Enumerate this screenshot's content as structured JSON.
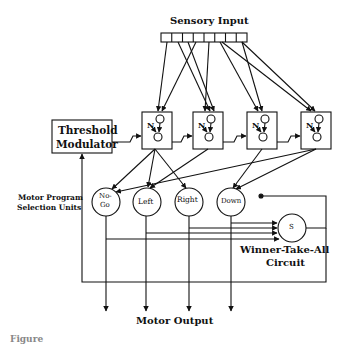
{
  "diagram": {
    "title_top": "Sensory Input",
    "input_cells": 8,
    "threshold_modulator": [
      "Threshold",
      "Modulator"
    ],
    "modules": [
      {
        "id": "m1",
        "label": "N"
      },
      {
        "id": "m2",
        "label": "N"
      },
      {
        "id": "m3",
        "label": "N"
      },
      {
        "id": "m4",
        "label": "N"
      }
    ],
    "side_label": [
      "Motor Program",
      "Selection Units"
    ],
    "selection_units": [
      {
        "id": "nogo",
        "label_lines": [
          "No-",
          "Go"
        ]
      },
      {
        "id": "left",
        "label_lines": [
          "Left"
        ]
      },
      {
        "id": "right",
        "label_lines": [
          "Right"
        ]
      },
      {
        "id": "down",
        "label_lines": [
          "Down"
        ]
      }
    ],
    "wta_node": "S",
    "wta_label": [
      "Winner-Take-All",
      "Circuit"
    ],
    "output_label": "Motor Output",
    "caption_partial": "Figure"
  }
}
